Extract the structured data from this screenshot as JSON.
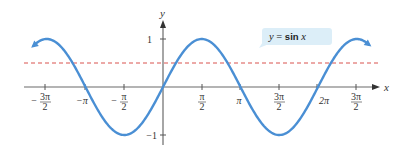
{
  "chart_data": {
    "type": "line",
    "title": "",
    "xlabel": "x",
    "ylabel": "y",
    "xlim": [
      -5.25,
      5.4
    ],
    "ylim": [
      -1.1,
      1.2
    ],
    "grid": false,
    "legend": null,
    "x_ticks": [
      {
        "value": -4.7124,
        "label": "-3π/2",
        "num": "3π",
        "den": "2",
        "neg": true
      },
      {
        "value": -3.1416,
        "label": "-π",
        "text": "−π"
      },
      {
        "value": -1.5708,
        "label": "-π/2",
        "num": "π",
        "den": "2",
        "neg": true
      },
      {
        "value": 1.5708,
        "label": "π/2",
        "num": "π",
        "den": "2",
        "neg": false
      },
      {
        "value": 3.1416,
        "label": "π",
        "text": "π"
      },
      {
        "value": 4.7124,
        "label": "3π/2",
        "num": "3π",
        "den": "2",
        "neg": false
      },
      {
        "value": 6.2832,
        "label": "2π",
        "text": "2π"
      },
      {
        "value": 7.854,
        "label": "5π/2 (printed as 3π/2)",
        "num": "3π",
        "den": "2",
        "neg": false
      }
    ],
    "y_ticks": [
      {
        "value": 1,
        "label": "1"
      },
      {
        "value": -1,
        "label": "−1"
      }
    ],
    "series": [
      {
        "name": "y = sin x",
        "function": "sin(x)",
        "x_range": [
          -5.25,
          8.35
        ],
        "color": "#4a8fd4",
        "style": "solid",
        "arrows": "both ends"
      },
      {
        "name": "y = 1/2",
        "function": "0.5",
        "x_range": [
          -5.25,
          8.5
        ],
        "color": "#d9534f",
        "style": "dashed"
      }
    ],
    "annotations": [
      {
        "text": "y = sin x",
        "type": "callout",
        "attached_to": "y = sin x"
      }
    ]
  },
  "labels": {
    "x_axis": "x",
    "y_axis": "y",
    "y_tick_pos": "1",
    "y_tick_neg": "−1",
    "callout": "y = sin x",
    "callout_y": "y",
    "callout_eq": " = ",
    "callout_sin": "sin",
    "callout_x": "x",
    "tick_neg_pi": "−π",
    "tick_pi": "π",
    "tick_2pi": "2π",
    "tick_3pi": "3π",
    "tick_pi_num": "π",
    "tick_den": "2",
    "minus": "−"
  },
  "colors": {
    "curve": "#4a8fd4",
    "dashed": "#d9534f",
    "axis": "#555555",
    "callout_bg": "#dceef8"
  }
}
